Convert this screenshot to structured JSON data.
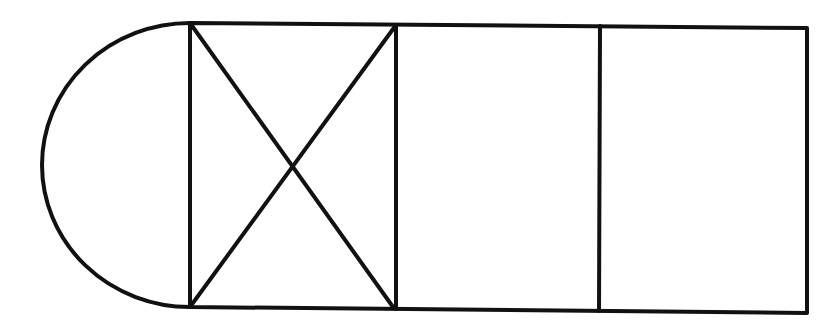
{
  "diagram": {
    "stroke_color": "#111111",
    "background_color": "#ffffff",
    "shapes": {
      "semicircle": {
        "cx": 190,
        "cy": 165,
        "r": 142,
        "side": "left"
      },
      "rectangle": {
        "top_left": [
          190,
          23
        ],
        "top_right": [
          807,
          27
        ],
        "bottom_right": [
          807,
          313
        ],
        "bottom_left": [
          190,
          307
        ]
      },
      "dividers_x": [
        396,
        600
      ],
      "crossed_cell_index": 0
    }
  }
}
